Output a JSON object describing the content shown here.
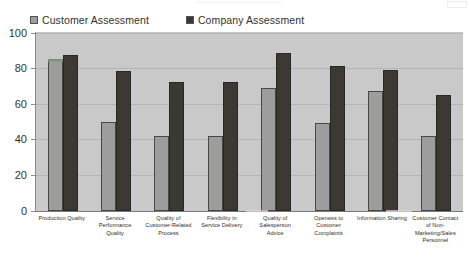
{
  "chart_data": {
    "type": "bar",
    "title": "",
    "xlabel": "",
    "ylabel": "",
    "ylim": [
      0,
      100
    ],
    "yticks": [
      0,
      20,
      40,
      60,
      80,
      100
    ],
    "grid": true,
    "legend_position": "top-left",
    "categories": [
      "Production Quality",
      "Service Performance Quality",
      "Quality of Customer-Related Process",
      "Flexibility in Service Delivery",
      "Quality of Salesperson Advice",
      "Openess to Customer Complaints",
      "Information Sharing",
      "Customer Contact of Non-Marketing/Sales Personnel"
    ],
    "category_lines": [
      [
        "Production Quality"
      ],
      [
        "Service",
        "Performance",
        "Quality"
      ],
      [
        "Quality of",
        "Customer-Related",
        "Process"
      ],
      [
        "Flexibility in",
        "Service Delivery"
      ],
      [
        "Quality of",
        "Salesperson",
        "Advice"
      ],
      [
        "Openess to",
        "Customer",
        "Complaints"
      ],
      [
        "Information Sharing"
      ],
      [
        "Customer Contact",
        "of Non-",
        "Marketing/Sales",
        "Personnel"
      ]
    ],
    "series": [
      {
        "name": "Customer Assessment",
        "color": "#9d9d9d",
        "values": [
          85,
          50,
          42,
          42,
          69,
          49,
          67,
          42
        ]
      },
      {
        "name": "Company Assessment",
        "color": "#3c3935",
        "values": [
          87,
          78,
          72,
          72,
          88,
          81,
          79,
          65
        ]
      }
    ]
  },
  "legend": {
    "items": [
      {
        "label": "Customer Assessment",
        "swatch": "customer-swatch"
      },
      {
        "label": "Company Assessment",
        "swatch": "company-swatch"
      }
    ]
  },
  "axis": {
    "y_tick_labels": [
      "100",
      "80",
      "60",
      "40",
      "20",
      "0"
    ]
  }
}
